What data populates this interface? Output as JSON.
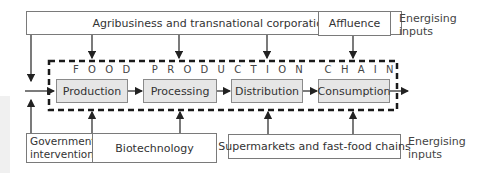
{
  "diagram": {
    "title": "FOOD PRODUCTION CHAIN",
    "top_inputs": [
      {
        "label": "Agribusiness and transnational corporations"
      },
      {
        "label": "Affluence"
      }
    ],
    "top_side_label": "Energising inputs",
    "stages": [
      {
        "label": "Production"
      },
      {
        "label": "Processing"
      },
      {
        "label": "Distribution"
      },
      {
        "label": "Consumption"
      }
    ],
    "bottom_inputs": [
      {
        "label": "Government intervention"
      },
      {
        "label": "Biotechnology"
      },
      {
        "label": "Supermarkets and fast-food chains"
      }
    ],
    "bottom_side_label": "Energising inputs"
  }
}
